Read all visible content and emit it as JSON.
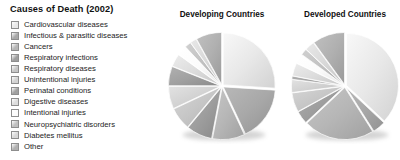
{
  "title": "Causes of Death (2002)",
  "legend": {
    "items": [
      {
        "label": "Cardiovascular diseases",
        "color": "#e8e8e8"
      },
      {
        "label": "Infectious & parasitic diseases",
        "color": "#a8a8a8"
      },
      {
        "label": "Cancers",
        "color": "#b6b6b6"
      },
      {
        "label": "Respiratory infections",
        "color": "#9e9e9e"
      },
      {
        "label": "Respiratory diseases",
        "color": "#c6c6c6"
      },
      {
        "label": "Unintentional injuries",
        "color": "#d2d2d2"
      },
      {
        "label": "Perinatal conditions",
        "color": "#a0a0a0"
      },
      {
        "label": "Digestive diseases",
        "color": "#dcdcdc"
      },
      {
        "label": "Intentional injuries",
        "color": "#fbfbfb"
      },
      {
        "label": "Neuropsychiatric disorders",
        "color": "#c0c0c0"
      },
      {
        "label": "Diabetes mellitus",
        "color": "#d8d8d8"
      },
      {
        "label": "Other",
        "color": "#b0b0b0"
      }
    ]
  },
  "charts": [
    {
      "heading": "Developing Countries"
    },
    {
      "heading": "Developed Countries"
    }
  ],
  "chart_data": [
    {
      "type": "pie",
      "title": "Developing Countries",
      "categories": [
        "Cardiovascular diseases",
        "Infectious & parasitic diseases",
        "Cancers",
        "Respiratory infections",
        "Respiratory diseases",
        "Unintentional injuries",
        "Perinatal conditions",
        "Digestive diseases",
        "Intentional injuries",
        "Neuropsychiatric disorders",
        "Diabetes mellitus",
        "Other"
      ],
      "values": [
        26,
        17,
        10,
        8,
        7,
        7,
        6,
        4,
        3,
        2,
        2,
        8
      ],
      "unit": "percent",
      "colors": [
        "#e8e8e8",
        "#a8a8a8",
        "#b6b6b6",
        "#9e9e9e",
        "#c6c6c6",
        "#d2d2d2",
        "#a0a0a0",
        "#dcdcdc",
        "#fbfbfb",
        "#c0c0c0",
        "#d8d8d8",
        "#b0b0b0"
      ],
      "start_angle": 0,
      "legend_position": "left",
      "grid": false
    },
    {
      "type": "pie",
      "title": "Developed Countries",
      "categories": [
        "Cardiovascular diseases",
        "Infectious & parasitic diseases",
        "Cancers",
        "Respiratory infections",
        "Respiratory diseases",
        "Unintentional injuries",
        "Perinatal conditions",
        "Digestive diseases",
        "Intentional injuries",
        "Neuropsychiatric disorders",
        "Diabetes mellitus",
        "Other"
      ],
      "values": [
        37,
        4,
        22,
        4,
        6,
        4,
        1,
        4,
        3,
        2,
        3,
        10
      ],
      "unit": "percent",
      "colors": [
        "#e8e8e8",
        "#a8a8a8",
        "#b6b6b6",
        "#9e9e9e",
        "#c6c6c6",
        "#d2d2d2",
        "#a0a0a0",
        "#dcdcdc",
        "#fbfbfb",
        "#c0c0c0",
        "#d8d8d8",
        "#b0b0b0"
      ],
      "start_angle": 0,
      "legend_position": "left",
      "grid": false
    }
  ]
}
